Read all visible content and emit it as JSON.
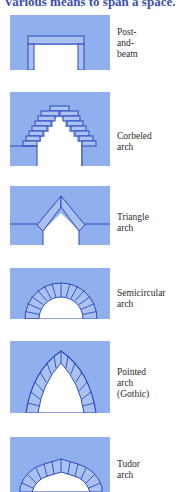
{
  "title": "Various means to span a space.",
  "colors": {
    "fill": "#8fb0ec",
    "stroke": "#2c47c4",
    "title": "#3a50b0",
    "label": "#2a2a2a",
    "background": "#ffffff"
  },
  "arches": [
    {
      "id": "post-and-beam",
      "label_lines": [
        "Post-",
        "and-",
        "beam"
      ]
    },
    {
      "id": "corbeled",
      "label_lines": [
        "Corbeled",
        "arch"
      ]
    },
    {
      "id": "triangle",
      "label_lines": [
        "Triangle",
        "arch"
      ]
    },
    {
      "id": "semicircular",
      "label_lines": [
        "Semicircular",
        "arch"
      ]
    },
    {
      "id": "pointed",
      "label_lines": [
        "Pointed",
        "arch",
        "(Gothic)"
      ]
    },
    {
      "id": "tudor",
      "label_lines": [
        "Tudor",
        "arch"
      ]
    }
  ]
}
